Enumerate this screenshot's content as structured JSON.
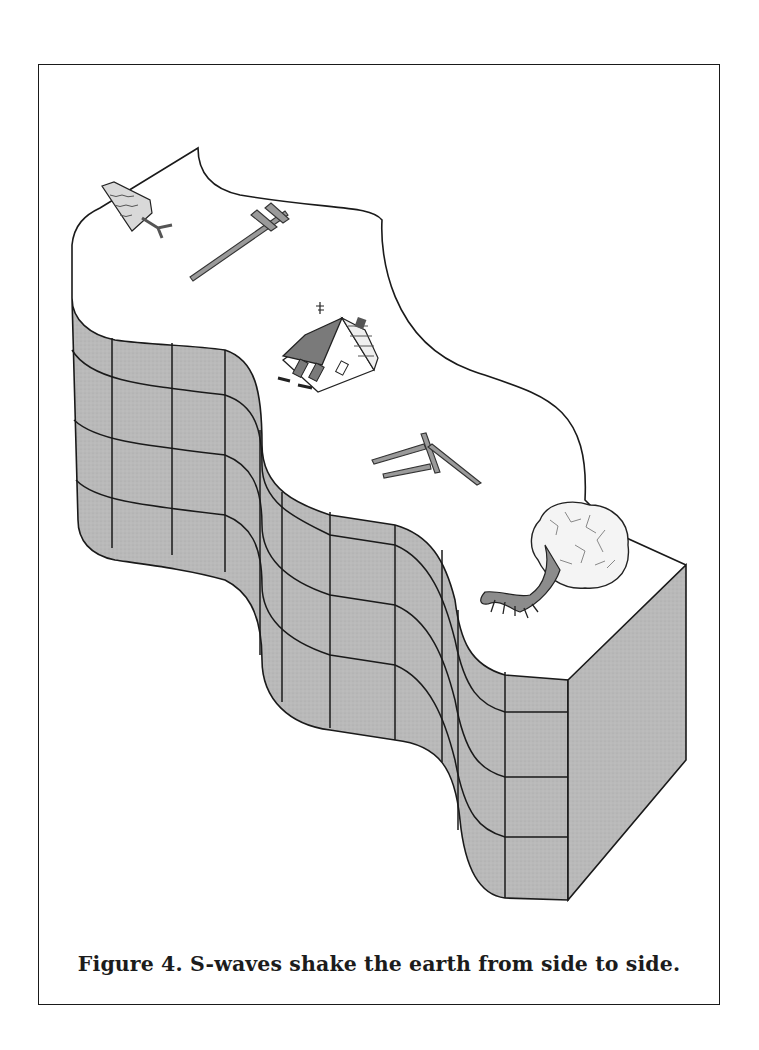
{
  "figure": {
    "number": "Figure 4.",
    "caption_text": "S-waves shake the earth from side to side.",
    "caption_full": "Figure 4.  S-waves shake the earth from side  to  side.",
    "illustration": {
      "subject": "block of earth deformed into an S-shaped wave, shaken sideways",
      "objects": [
        "pine-tree",
        "fallen-utility-pole",
        "tilted-house",
        "collapsed-fence",
        "uprooted-tree"
      ],
      "colors": {
        "wall_fill": "#b9b9b9",
        "outline": "#1a1a1a",
        "surface": "#ffffff",
        "object_fill": "#8c8c8c"
      },
      "grid": {
        "rows": 4,
        "columns_visible": 11
      }
    }
  }
}
